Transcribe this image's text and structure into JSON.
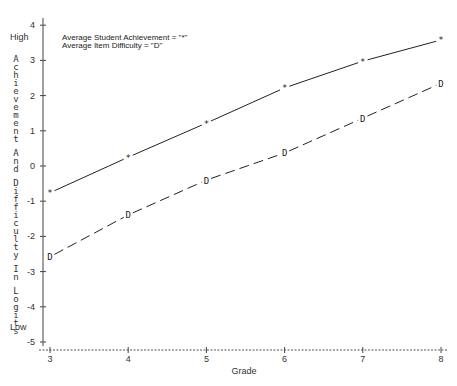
{
  "chart_data": {
    "type": "line",
    "title": "",
    "xlabel": "Grade",
    "ylabel": "Achievement And Difficulty In Logits",
    "ylabel_top": "High",
    "ylabel_bottom": "Low",
    "x": [
      3,
      4,
      5,
      6,
      7,
      8
    ],
    "x_ticks": [
      "3",
      "4",
      "5",
      "6",
      "7",
      "8"
    ],
    "y_ticks": [
      "4",
      "3",
      "2",
      "1",
      "0",
      "-1",
      "-2",
      "-3",
      "-4",
      "-5"
    ],
    "y_tick_values": [
      4,
      3,
      2,
      1,
      0,
      -1,
      -2,
      -3,
      -4,
      -5
    ],
    "xlim": [
      3,
      8
    ],
    "ylim": [
      -5.2,
      4.4
    ],
    "grid": false,
    "legend_placement": "top-left",
    "series": [
      {
        "name": "Average Student Achievement",
        "legend_label": "Average Student Achievement = \"*\"",
        "marker": "*",
        "line_style": "solid",
        "values": [
          -0.76,
          0.25,
          1.22,
          2.22,
          2.98,
          3.58
        ]
      },
      {
        "name": "Average Item Difficulty",
        "legend_label": "Average Item Difficulty = \"D\"",
        "marker": "D",
        "line_style": "dashed",
        "values": [
          -2.58,
          -1.39,
          -0.4,
          0.37,
          1.36,
          2.35
        ]
      }
    ]
  }
}
